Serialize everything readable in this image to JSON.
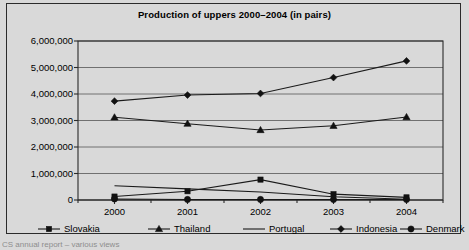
{
  "frame": {
    "border_color": "#2b2b2b",
    "background": "#d9d9d9"
  },
  "caption": {
    "text": "CS annual report – various views"
  },
  "legend": {
    "position": "bottom",
    "entries": [
      {
        "label": "Slovakia",
        "marker": "square"
      },
      {
        "label": "Thailand",
        "marker": "triangle"
      },
      {
        "label": "Portugal",
        "marker": "none"
      },
      {
        "label": "Indonesia",
        "marker": "diamond"
      },
      {
        "label": "Denmark",
        "marker": "circle"
      }
    ]
  },
  "chart_data": {
    "type": "line",
    "title": "Production of uppers 2000–2004 (in pairs)",
    "xlabel": "",
    "ylabel": "",
    "grid": true,
    "legend_position": "bottom",
    "categories": [
      "2000",
      "2001",
      "2002",
      "2003",
      "2004"
    ],
    "x": [
      2000,
      2001,
      2002,
      2003,
      2004
    ],
    "ylim": [
      0,
      6000000
    ],
    "ytick_values": [
      0,
      1000000,
      2000000,
      3000000,
      4000000,
      5000000,
      6000000
    ],
    "ytick_labels": [
      "0",
      "1,000,000",
      "2,000,000",
      "3,000,000",
      "4,000,000",
      "5,000,000",
      "6,000,000"
    ],
    "series": [
      {
        "name": "Slovakia",
        "marker": "square",
        "values": [
          130000,
          330000,
          770000,
          220000,
          100000
        ]
      },
      {
        "name": "Thailand",
        "marker": "triangle",
        "values": [
          3120000,
          2880000,
          2640000,
          2800000,
          3130000
        ]
      },
      {
        "name": "Portugal",
        "marker": "none",
        "values": [
          540000,
          420000,
          300000,
          120000,
          30000
        ]
      },
      {
        "name": "Indonesia",
        "marker": "diamond",
        "values": [
          3730000,
          3960000,
          4020000,
          4620000,
          5250000
        ]
      },
      {
        "name": "Denmark",
        "marker": "circle",
        "values": [
          40000,
          20000,
          20000,
          20000,
          20000
        ]
      }
    ]
  }
}
